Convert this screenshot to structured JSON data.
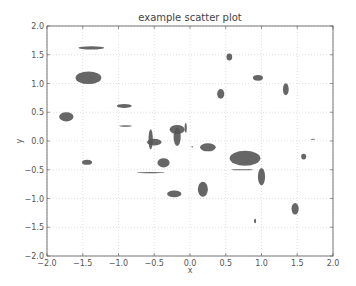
{
  "chart_data": {
    "type": "scatter",
    "marker": "ellipse",
    "title": "example scatter plot",
    "xlabel": "x",
    "ylabel": "y",
    "xlim": [
      -2.0,
      2.0
    ],
    "ylim": [
      -2.0,
      2.0
    ],
    "grid": true,
    "legend": null,
    "xticks": [
      "-2.0",
      "-1.5",
      "-1.0",
      "-0.5",
      "0.0",
      "0.5",
      "1.0",
      "1.5",
      "2.0"
    ],
    "yticks": [
      "2.0",
      "1.5",
      "1.0",
      "0.5",
      "0.0",
      "-0.5",
      "-1.0",
      "-1.5",
      "-2.0"
    ],
    "color": "#555555",
    "ellipses": [
      {
        "x": -1.38,
        "y": 1.62,
        "width": 0.36,
        "height": 0.06
      },
      {
        "x": -1.42,
        "y": 1.1,
        "width": 0.36,
        "height": 0.22
      },
      {
        "x": -1.73,
        "y": 0.42,
        "width": 0.2,
        "height": 0.16
      },
      {
        "x": -0.92,
        "y": 0.61,
        "width": 0.21,
        "height": 0.07
      },
      {
        "x": -0.9,
        "y": 0.26,
        "width": 0.18,
        "height": 0.025
      },
      {
        "x": -1.44,
        "y": -0.37,
        "width": 0.14,
        "height": 0.09
      },
      {
        "x": -0.55,
        "y": 0.03,
        "width": 0.06,
        "height": 0.35
      },
      {
        "x": -0.5,
        "y": -0.02,
        "width": 0.2,
        "height": 0.12
      },
      {
        "x": -0.37,
        "y": -0.38,
        "width": 0.17,
        "height": 0.16
      },
      {
        "x": -0.55,
        "y": -0.55,
        "width": 0.39,
        "height": 0.02
      },
      {
        "x": -0.22,
        "y": -0.92,
        "width": 0.2,
        "height": 0.12
      },
      {
        "x": -0.18,
        "y": 0.2,
        "width": 0.21,
        "height": 0.16
      },
      {
        "x": -0.18,
        "y": 0.07,
        "width": 0.1,
        "height": 0.31
      },
      {
        "x": -0.06,
        "y": 0.23,
        "width": 0.03,
        "height": 0.17
      },
      {
        "x": 0.03,
        "y": -0.1,
        "width": 0.02,
        "height": 0.03
      },
      {
        "x": 0.25,
        "y": -0.11,
        "width": 0.22,
        "height": 0.14
      },
      {
        "x": 0.18,
        "y": -0.84,
        "width": 0.14,
        "height": 0.26
      },
      {
        "x": 0.55,
        "y": 1.46,
        "width": 0.08,
        "height": 0.12
      },
      {
        "x": 0.43,
        "y": 0.82,
        "width": 0.1,
        "height": 0.17
      },
      {
        "x": 0.95,
        "y": 1.1,
        "width": 0.14,
        "height": 0.1
      },
      {
        "x": 1.34,
        "y": 0.9,
        "width": 0.08,
        "height": 0.21
      },
      {
        "x": 0.77,
        "y": -0.3,
        "width": 0.43,
        "height": 0.26
      },
      {
        "x": 0.73,
        "y": -0.5,
        "width": 0.31,
        "height": 0.02
      },
      {
        "x": 1.0,
        "y": -0.62,
        "width": 0.1,
        "height": 0.3
      },
      {
        "x": 1.59,
        "y": -0.27,
        "width": 0.07,
        "height": 0.1
      },
      {
        "x": 1.72,
        "y": 0.03,
        "width": 0.06,
        "height": 0.02
      },
      {
        "x": 1.47,
        "y": -1.18,
        "width": 0.1,
        "height": 0.2
      },
      {
        "x": 0.91,
        "y": -1.39,
        "width": 0.03,
        "height": 0.08
      }
    ]
  }
}
